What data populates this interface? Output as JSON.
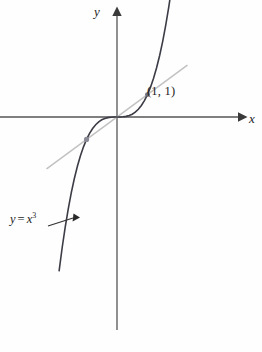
{
  "figure": {
    "background_color": "#fefefe"
  },
  "axes": {
    "x_label": "x",
    "y_label": "y",
    "axis_color": "#555555",
    "origin_px": [
      117,
      117
    ]
  },
  "annotations": {
    "point_label": "(1, 1)",
    "curve_label_lhs": "y",
    "curve_label_eq": "=",
    "curve_label_base": "x",
    "curve_label_exp": "3"
  },
  "chart_data": {
    "type": "line",
    "title": "",
    "xlabel": "x",
    "ylabel": "y",
    "grid": false,
    "legend": null,
    "xlim": [
      -4.2,
      4.4
    ],
    "ylim": [
      -7.3,
      8.4
    ],
    "series": [
      {
        "name": "y = x^3",
        "color": "#3c3c46",
        "x": [
          -1.9,
          -1.8,
          -1.7,
          -1.6,
          -1.5,
          -1.4,
          -1.3,
          -1.2,
          -1.1,
          -1.0,
          -0.9,
          -0.8,
          -0.7,
          -0.6,
          -0.5,
          -0.4,
          -0.3,
          -0.2,
          -0.1,
          0.0,
          0.1,
          0.2,
          0.3,
          0.4,
          0.5,
          0.6,
          0.7,
          0.8,
          0.9,
          1.0,
          1.1,
          1.2,
          1.3,
          1.4,
          1.5,
          1.6,
          1.7,
          1.8,
          1.9,
          2.0
        ],
        "y": [
          -6.859,
          -5.832,
          -4.913,
          -4.096,
          -3.375,
          -2.744,
          -2.197,
          -1.728,
          -1.331,
          -1.0,
          -0.729,
          -0.512,
          -0.343,
          -0.216,
          -0.125,
          -0.064,
          -0.027,
          -0.008,
          -0.001,
          0.0,
          0.001,
          0.008,
          0.027,
          0.064,
          0.125,
          0.216,
          0.343,
          0.512,
          0.729,
          1.0,
          1.331,
          1.728,
          2.197,
          2.744,
          3.375,
          4.096,
          4.913,
          5.832,
          6.859,
          8.0
        ]
      },
      {
        "name": "y = x",
        "color": "#c2c2c2",
        "x": [
          -2.3,
          2.3
        ],
        "y": [
          -2.3,
          2.3
        ]
      }
    ],
    "points": [
      {
        "label": "(1, 1)",
        "x": 1,
        "y": 1,
        "color": "#6b6b78"
      },
      {
        "label": "",
        "x": -1,
        "y": -1,
        "color": "#8a8a96"
      }
    ],
    "annotations": [
      {
        "text": "y = x^3",
        "x": -3.3,
        "y": -3.2,
        "arrow_to": [
          -1.55,
          -3.6
        ]
      }
    ]
  }
}
